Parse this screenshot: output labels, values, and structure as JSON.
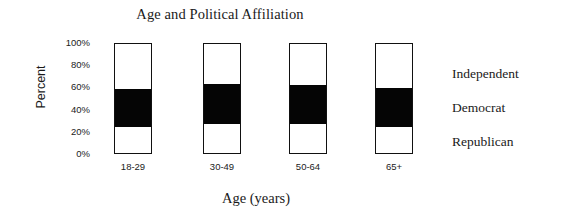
{
  "chart_data": {
    "type": "bar",
    "subtype": "stacked-bar-100-percent",
    "title": "Age and Political Affiliation",
    "xlabel": "Age (years)",
    "ylabel": "Percent",
    "categories": [
      "18-29",
      "30-49",
      "50-64",
      "65+"
    ],
    "ylim": [
      0,
      100
    ],
    "ytick_labels": [
      "0%",
      "20%",
      "40%",
      "60%",
      "80%",
      "100%"
    ],
    "ytick_values": [
      0,
      20,
      40,
      60,
      80,
      100
    ],
    "grid": false,
    "legend_position": "right",
    "series": [
      {
        "name": "Independent",
        "color": "#ffffff",
        "values": [
          41,
          37,
          38,
          40
        ]
      },
      {
        "name": "Democrat",
        "color": "#050505",
        "values": [
          35,
          36,
          35,
          36
        ]
      },
      {
        "name": "Republican",
        "color": "#ffffff",
        "values": [
          24,
          27,
          27,
          24
        ]
      }
    ]
  },
  "legend": {
    "entries": [
      {
        "label": "Independent"
      },
      {
        "label": "Democrat"
      },
      {
        "label": "Republican"
      }
    ]
  }
}
